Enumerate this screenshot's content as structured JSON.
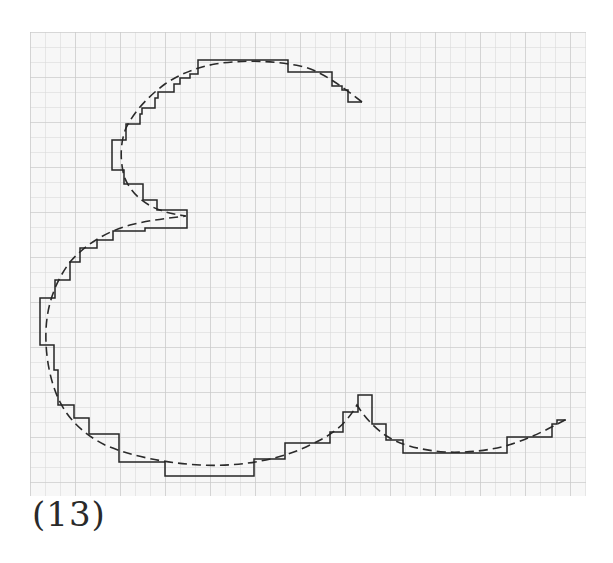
{
  "figure": {
    "caption": "(13)",
    "grid": {
      "x0": 30,
      "y0": 32,
      "x1": 586,
      "y1": 496,
      "cell": 15,
      "minor_color": "#d2d2d2",
      "major_color": "#c4c4c4",
      "background": "#f7f7f7"
    },
    "curve": {
      "style": "dashed",
      "color": "#2b2b2b",
      "path": "M 362 102 C 340 85 320 70 300 66 C 270 60 240 60 215 64 C 195 68 180 74 165 84 C 150 95 135 110 126 128 C 120 143 120 160 124 176 C 130 193 145 205 160 210 C 170 214 180 215 186 216 C 170 218 150 220 130 225 C 105 232 85 245 70 262 C 55 282 47 305 46 330 C 45 355 50 380 58 398 C 68 420 85 435 105 445 C 130 456 165 463 200 465 C 240 467 280 460 310 445 C 330 436 345 426 357 405 C 365 418 375 428 385 435 C 400 445 420 450 445 452 C 470 453 495 450 515 443 C 535 436 550 428 565 420"
    },
    "staircase": {
      "style": "solid",
      "color": "#262626",
      "path": "M 362 102 L 348 102 L 348 90 L 342 90 L 342 86 L 332 86 L 332 72 L 288 72 L 288 60 L 198 60 L 198 74 L 190 74 L 190 78 L 180 78 L 180 84 L 174 84 L 174 92 L 158 92 L 158 98 L 155 98 L 155 108 L 142 108 L 142 114 L 140 114 L 140 124 L 126 124 L 126 140 L 112 140 L 112 170 L 124 170 L 124 184 L 143 184 L 143 200 L 157 200 L 157 210 L 187 210 L 187 228 L 145 228 L 145 231 L 113 231 L 113 240 L 97 240 L 97 248 L 80 248 L 80 262 L 70 262 L 70 280 L 55 280 L 55 298 L 40 298 L 40 345 L 54 345 L 54 370 L 58 370 L 58 405 L 74 405 L 74 418 L 89 418 L 89 434 L 119 434 L 119 462 L 165 462 L 165 476 L 254 476 L 254 459 L 285 459 L 285 443 L 330 443 L 330 432 L 343 432 L 343 412 L 358 412 L 358 395 L 372 395 L 372 424 L 386 424 L 386 440 L 403 440 L 403 453 L 507 453 L 507 437 L 552 437 L 552 424 L 557 424 L 557 420 L 566 420"
    }
  }
}
